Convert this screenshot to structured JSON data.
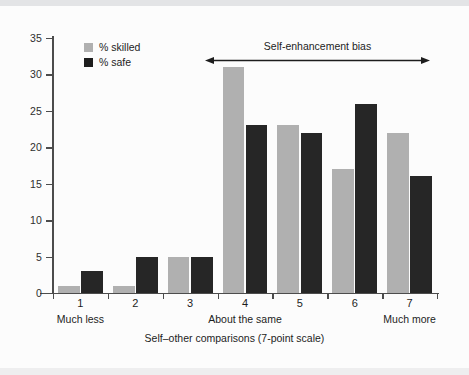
{
  "chart_data": {
    "type": "bar",
    "title": "",
    "subtitle": "",
    "xlabel": "Self–other comparisons (7-point scale)",
    "ylabel": "",
    "categories": [
      "1",
      "2",
      "3",
      "4",
      "5",
      "6",
      "7"
    ],
    "category_group_labels": [
      {
        "category": "1",
        "label": "Much less"
      },
      {
        "category": "4",
        "label": "About the same"
      },
      {
        "category": "7",
        "label": "Much more"
      }
    ],
    "series": [
      {
        "name": "% skilled",
        "color": "#b0b0b0",
        "values": [
          1,
          1,
          5,
          31,
          23,
          17,
          22
        ]
      },
      {
        "name": "% safe",
        "color": "#262626",
        "values": [
          3,
          5,
          5,
          23,
          22,
          26,
          16
        ]
      }
    ],
    "ylim": [
      0,
      35
    ],
    "ytick_values": [
      0,
      5,
      10,
      15,
      20,
      25,
      30,
      35
    ],
    "ytick_labels": [
      "0",
      "5",
      "10",
      "15",
      "20",
      "25",
      "30",
      "35"
    ],
    "grid": false,
    "legend_position": "top-left",
    "annotations": [
      {
        "text": "Self-enhancement bias",
        "type": "double-headed-arrow",
        "spans_categories": [
          "4",
          "7"
        ]
      }
    ]
  },
  "legend": {
    "items": [
      {
        "label": "% skilled",
        "color": "#b0b0b0"
      },
      {
        "label": "% safe",
        "color": "#1d1d1d"
      }
    ]
  },
  "colors": {
    "skilled": "#b0b0b0",
    "safe": "#262626",
    "axis": "#4c4c4c",
    "text": "#1d1d1d",
    "background": "#fcfcfc"
  }
}
